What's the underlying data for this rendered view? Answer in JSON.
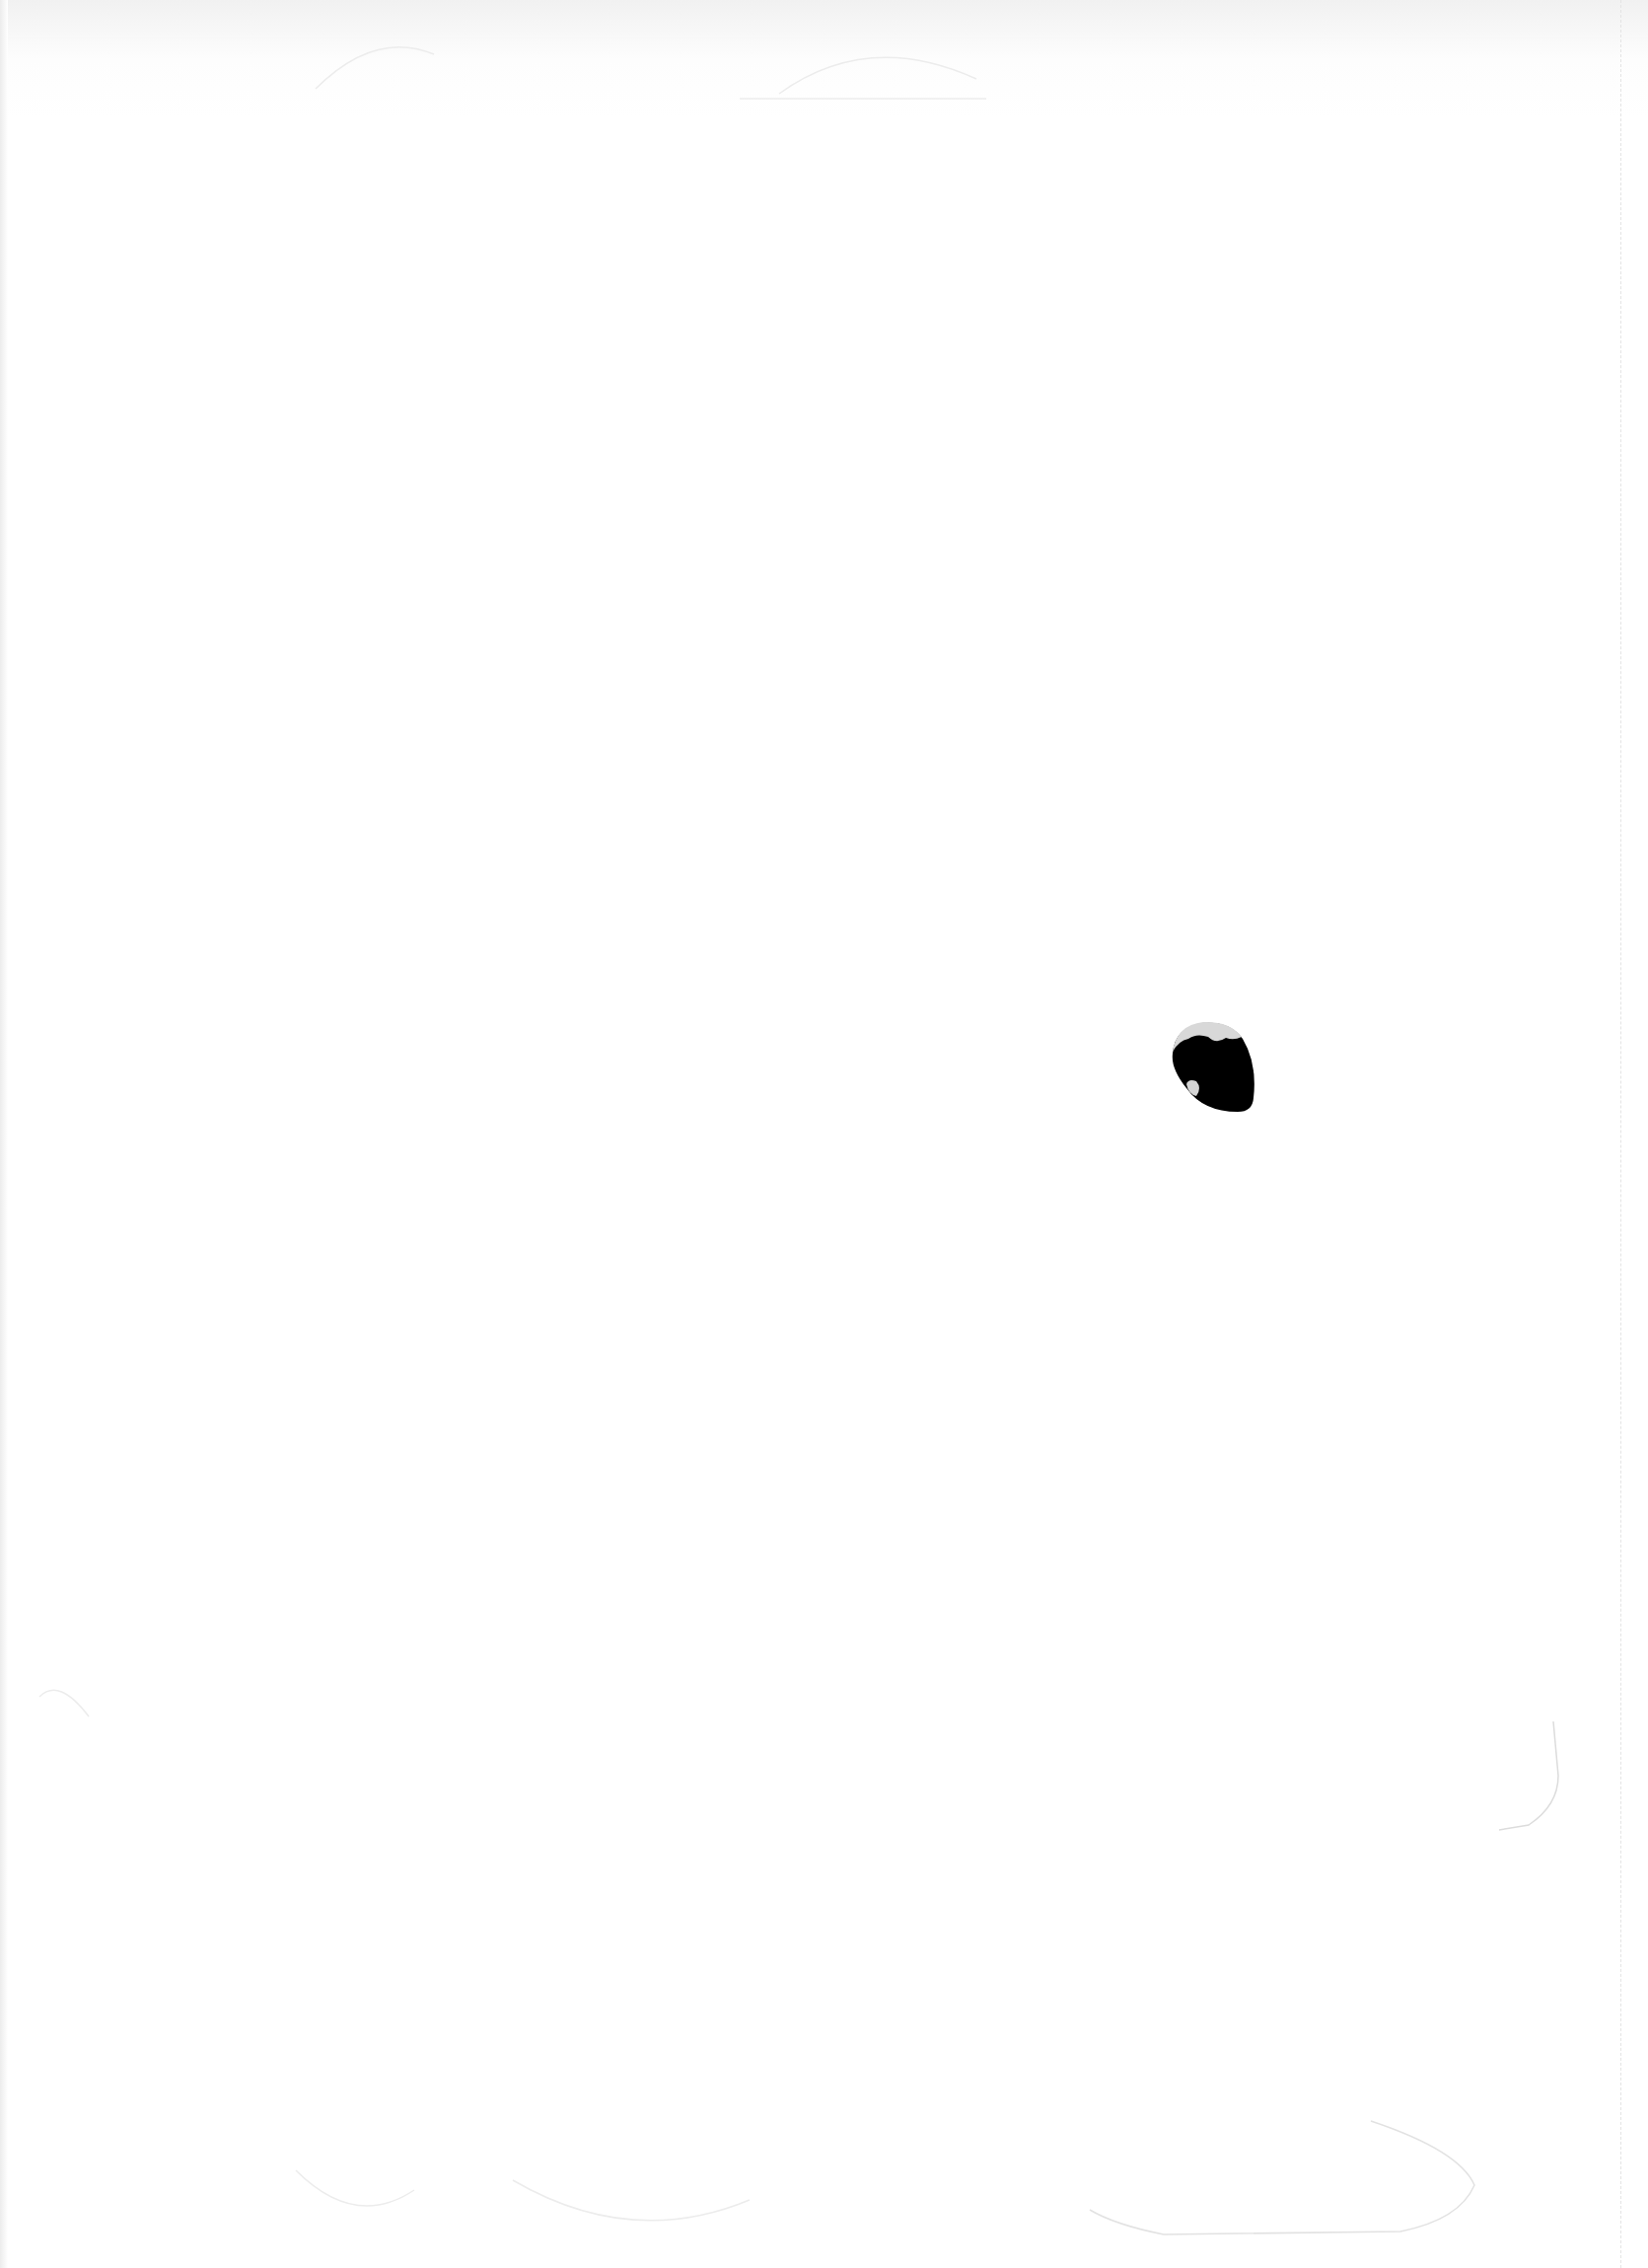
{
  "page": {
    "background_color": "#ffffff",
    "mark": {
      "name": "ink-blot",
      "color": "#000000",
      "highlight_color": "#d8d8d8"
    }
  }
}
